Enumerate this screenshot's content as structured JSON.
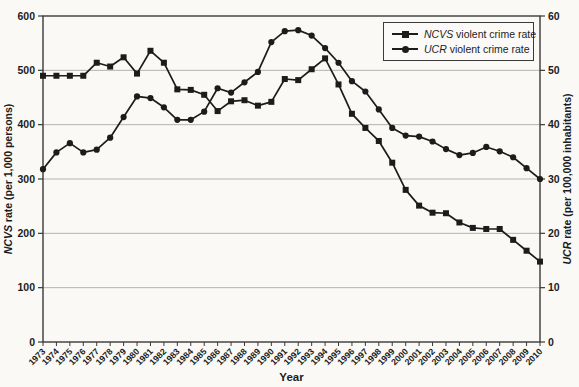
{
  "figure": {
    "background": "#faf9f6",
    "x_axis_title": "Year"
  },
  "chart_data": {
    "type": "line",
    "title": "",
    "xlabel": "Year",
    "grid": "horizontal",
    "legend_position": "top-right",
    "years": [
      1973,
      1974,
      1975,
      1976,
      1977,
      1978,
      1979,
      1980,
      1981,
      1982,
      1983,
      1984,
      1985,
      1986,
      1987,
      1988,
      1989,
      1990,
      1991,
      1992,
      1993,
      1994,
      1995,
      1996,
      1997,
      1998,
      1999,
      2000,
      2001,
      2002,
      2003,
      2004,
      2005,
      2006,
      2007,
      2008,
      2009,
      2010
    ],
    "left_axis": {
      "label_italic": "NCVS",
      "label_rest": " rate (per 1,000 persons)",
      "min": 0,
      "max": 600,
      "step": 100,
      "ticks": [
        "0",
        "100",
        "200",
        "300",
        "400",
        "500",
        "600"
      ]
    },
    "right_axis": {
      "label_italic": "UCR",
      "label_rest": " rate (per 100,000 inhabitants)",
      "min": 0,
      "max": 60,
      "step": 10,
      "ticks": [
        "0",
        "10",
        "20",
        "30",
        "40",
        "50",
        "60"
      ]
    },
    "series": [
      {
        "name": "NCVS violent crime rate",
        "name_italic": "NCVS",
        "name_rest": " violent crime rate",
        "marker": "square",
        "axis": "left",
        "values": [
          490,
          490,
          490,
          490,
          514,
          507,
          524,
          494,
          536,
          514,
          465,
          464,
          455,
          425,
          443,
          445,
          435,
          442,
          484,
          482,
          502,
          522,
          474,
          420,
          394,
          370,
          330,
          280,
          251,
          238,
          237,
          220,
          210,
          208,
          208,
          188,
          168,
          148
        ]
      },
      {
        "name": "UCR violent crime rate",
        "name_italic": "UCR",
        "name_rest": " violent crime rate",
        "marker": "circle",
        "axis": "right",
        "values": [
          31.8,
          34.9,
          36.6,
          34.9,
          35.4,
          37.6,
          41.4,
          45.2,
          44.9,
          43.2,
          40.9,
          40.9,
          42.4,
          46.7,
          45.9,
          47.8,
          49.7,
          55.2,
          57.2,
          57.4,
          56.4,
          54.1,
          51.4,
          48.0,
          46.1,
          42.8,
          39.4,
          38.0,
          37.8,
          36.9,
          35.5,
          34.4,
          34.8,
          35.9,
          35.1,
          34.0,
          32.0,
          30.0
        ]
      }
    ],
    "colors": {
      "line": "#1c1c1c",
      "grid": "#b5b3ae",
      "frame": "#3a3a38",
      "text": "#1c1c1c"
    }
  }
}
